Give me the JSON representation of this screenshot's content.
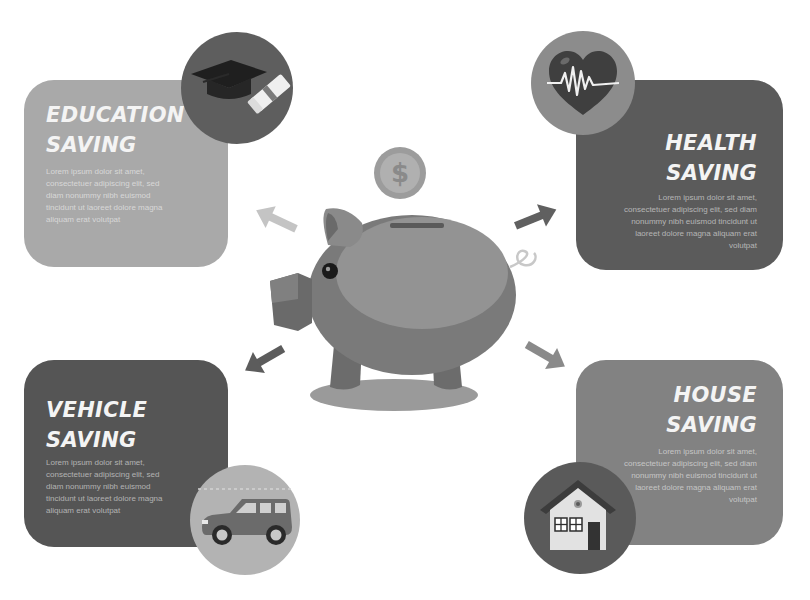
{
  "infographic": {
    "center": {
      "illustration": "piggy-bank",
      "coin_symbol": "$"
    },
    "cards": [
      {
        "id": "education",
        "title_line1": "EDUCATION",
        "title_line2": "SAVING",
        "body": "Lorem ipsum dolor sit amet, consectetuer adipiscing elit, sed diam nonummy nibh euismod tincidunt ut laoreet dolore magna aliquam erat volutpat",
        "icon": "graduation-cap-icon",
        "card_color": "#a9a9a9",
        "icon_bg_color": "#5e5e5e"
      },
      {
        "id": "health",
        "title_line1": "HEALTH",
        "title_line2": "SAVING",
        "body": "Lorem ipsum dolor sit amet, consectetuer adipiscing elit, sed diam nonummy nibh euismod tincidunt ut laoreet dolore magna aliquam erat volutpat",
        "icon": "heartbeat-icon",
        "card_color": "#5b5b5b",
        "icon_bg_color": "#8c8c8c"
      },
      {
        "id": "vehicle",
        "title_line1": "VEHICLE",
        "title_line2": "SAVING",
        "body": "Lorem ipsum dolor sit amet, consectetuer adipiscing elit, sed diam nonummy nibh euismod tincidunt ut laoreet dolore magna aliquam erat volutpat",
        "icon": "car-icon",
        "card_color": "#555555",
        "icon_bg_color": "#b3b3b3"
      },
      {
        "id": "house",
        "title_line1": "HOUSE",
        "title_line2": "SAVING",
        "body": "Lorem ipsum dolor sit amet, consectetuer adipiscing elit, sed diam nonummy nibh euismod tincidunt ut laoreet dolore magna aliquam erat volutpat",
        "icon": "house-icon",
        "card_color": "#828282",
        "icon_bg_color": "#5a5a5a"
      }
    ]
  }
}
